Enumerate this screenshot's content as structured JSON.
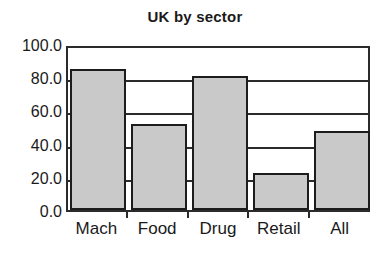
{
  "chart_data": {
    "type": "bar",
    "title": "UK by sector",
    "xlabel": "",
    "ylabel": "",
    "categories": [
      "Mach",
      "Food",
      "Drug",
      "Retail",
      "All"
    ],
    "values": [
      85.0,
      52.0,
      80.5,
      22.0,
      47.5
    ],
    "ylim": [
      0.0,
      100.0
    ],
    "ytick_labels": [
      "100.0",
      "80.0",
      "60.0",
      "40.0",
      "20.0",
      "0.0"
    ],
    "ytick_values": [
      100.0,
      80.0,
      60.0,
      40.0,
      20.0,
      0.0
    ],
    "grid": true,
    "legend": null,
    "colors": {
      "bar_fill": "#c9c9c9",
      "bar_edge": "#1c1c1c",
      "axis": "#2b2b2b",
      "text": "#1a1a1a",
      "background": "#ffffff"
    }
  }
}
